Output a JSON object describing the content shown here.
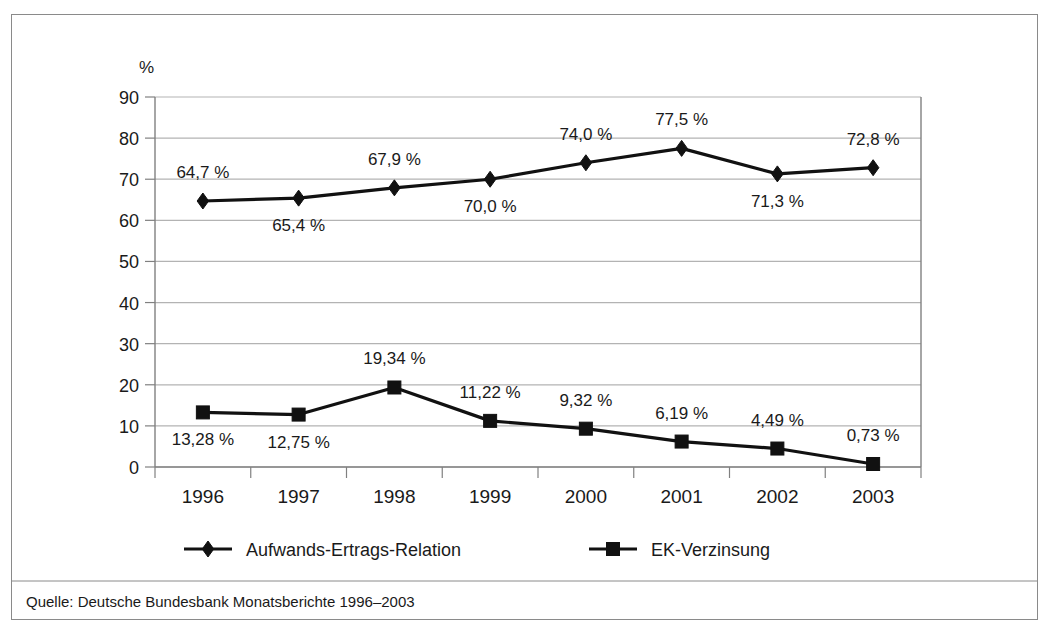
{
  "chart_data": {
    "type": "line",
    "title": "",
    "subtitle": "",
    "xlabel": "",
    "ylabel": "%",
    "ylim": [
      0,
      90
    ],
    "ytick_step": 10,
    "grid": true,
    "legend_position": "bottom",
    "categories": [
      "1996",
      "1997",
      "1998",
      "1999",
      "2000",
      "2001",
      "2002",
      "2003"
    ],
    "yticks": [
      "0",
      "10",
      "20",
      "30",
      "40",
      "50",
      "60",
      "70",
      "80",
      "90"
    ],
    "series": [
      {
        "name": "Aufwands-Ertrags-Relation",
        "marker": "diamond",
        "color": "#111111",
        "values": [
          64.7,
          65.4,
          67.9,
          70.0,
          74.0,
          77.5,
          71.3,
          72.8
        ],
        "labels": [
          "64,7 %",
          "65,4 %",
          "67,9 %",
          "70,0 %",
          "74,0 %",
          "77,5 %",
          "71,3 %",
          "72,8 %"
        ],
        "label_positions": [
          "above",
          "below",
          "above",
          "below",
          "above",
          "above",
          "below",
          "above"
        ]
      },
      {
        "name": "EK-Verzinsung",
        "marker": "square",
        "color": "#111111",
        "values": [
          13.28,
          12.75,
          19.34,
          11.22,
          9.32,
          6.19,
          4.49,
          0.73
        ],
        "labels": [
          "13,28 %",
          "12,75 %",
          "19,34 %",
          "11,22 %",
          "9,32 %",
          "6,19 %",
          "4,49 %",
          "0,73 %"
        ],
        "label_positions": [
          "below",
          "below",
          "above",
          "above",
          "above",
          "above",
          "above",
          "above"
        ]
      }
    ],
    "source": "Quelle: Deutsche Bundesbank Monatsberichte 1996–2003",
    "colors": {
      "gridline": "#b3b3b3",
      "axis": "#808080",
      "frame": "#8a8a8a",
      "line": "#111111",
      "text": "#1a1a1a"
    }
  }
}
